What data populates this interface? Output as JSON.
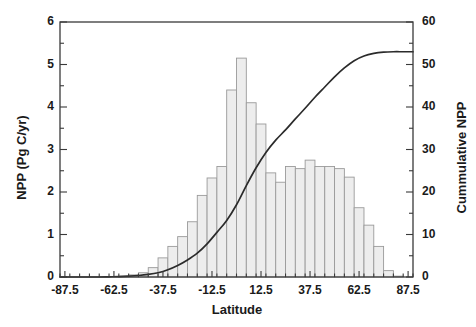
{
  "chart_data": {
    "type": "bar",
    "title": "",
    "subtitle": "",
    "xlabel": "Latitude",
    "ylabel": "NPP (Pg C/yr)",
    "y2label": "Cummulative NPP",
    "xlim": [
      -90,
      90
    ],
    "ylim": [
      0,
      6
    ],
    "y2lim": [
      0,
      60
    ],
    "xticks": [
      -87.5,
      -62.5,
      -37.5,
      -12.5,
      12.5,
      37.5,
      62.5,
      87.5
    ],
    "xtick_labels": [
      "-87.5",
      "-62.5",
      "-37.5",
      "-12.5",
      "12.5",
      "37.5",
      "62.5",
      "87.5"
    ],
    "yticks": [
      0,
      1,
      2,
      3,
      4,
      5,
      6
    ],
    "ytick_labels": [
      "0",
      "1",
      "2",
      "3",
      "4",
      "5",
      "6"
    ],
    "y2ticks": [
      0,
      10,
      20,
      30,
      40,
      50,
      60
    ],
    "y2tick_labels": [
      "0",
      "10",
      "20",
      "30",
      "40",
      "50",
      "60"
    ],
    "yminor_step": 0.5,
    "y2minor_step": 5,
    "grid": false,
    "legend": "none",
    "bin_width": 5,
    "bar_color": "#ededed",
    "bar_edge_color": "#9a9a9a",
    "line_color": "#2b2b2b",
    "axis_color": "#3a3a3a",
    "categories": [
      -87.5,
      -82.5,
      -77.5,
      -72.5,
      -67.5,
      -62.5,
      -57.5,
      -52.5,
      -47.5,
      -42.5,
      -37.5,
      -32.5,
      -27.5,
      -22.5,
      -17.5,
      -12.5,
      -7.5,
      -2.5,
      2.5,
      7.5,
      12.5,
      17.5,
      22.5,
      27.5,
      32.5,
      37.5,
      42.5,
      47.5,
      52.5,
      57.5,
      62.5,
      67.5,
      72.5,
      77.5,
      82.5,
      87.5
    ],
    "series": [
      {
        "name": "NPP (Pg C/yr)",
        "axis": "left",
        "values": [
          0.0,
          0.0,
          0.0,
          0.0,
          0.0,
          0.0,
          0.02,
          0.05,
          0.1,
          0.22,
          0.45,
          0.72,
          0.95,
          1.3,
          1.92,
          2.33,
          2.6,
          4.4,
          5.15,
          4.1,
          3.6,
          2.45,
          2.23,
          2.6,
          2.55,
          2.75,
          2.6,
          2.6,
          2.55,
          2.35,
          1.63,
          1.22,
          0.72,
          0.15,
          0.02,
          0.0
        ]
      },
      {
        "name": "Cummulative NPP",
        "axis": "right",
        "type": "line",
        "values": [
          0.0,
          0.0,
          0.0,
          0.0,
          0.05,
          0.1,
          0.2,
          0.35,
          0.6,
          1.0,
          1.7,
          2.7,
          4.0,
          5.6,
          7.8,
          10.5,
          13.3,
          17.0,
          21.5,
          25.7,
          29.3,
          32.2,
          34.6,
          37.2,
          39.7,
          42.3,
          44.7,
          47.1,
          49.2,
          50.9,
          52.0,
          52.6,
          52.9,
          53.0,
          53.0,
          53.0
        ]
      }
    ]
  }
}
